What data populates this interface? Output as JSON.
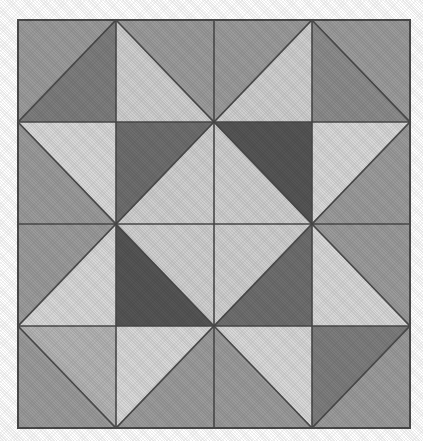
{
  "figure": {
    "kind": "geometric-pattern",
    "grid_rows": 4,
    "grid_cols": 4,
    "canvas_width": 423,
    "canvas_height": 441,
    "pattern_left": 18,
    "pattern_top": 20,
    "pattern_width": 392,
    "pattern_height": 408,
    "background_color": "#ffffff",
    "line_color": "#4a4a4a",
    "line_width": 1.6,
    "outer_border_color": "#4a4a4a",
    "outer_border_width": 2
  },
  "palette": {
    "lightest": "#d8d8d8",
    "light": "#cfcfcf",
    "medium_light": "#b4b4b4",
    "medium": "#9b9b9b",
    "medium_dark": "#8c8c8c",
    "dark": "#7d7d7d",
    "darker": "#6e6e6e",
    "darkest": "#555555"
  },
  "chart_data": {
    "type": "heatmap",
    "xlabel": "",
    "ylabel": "",
    "grid": {
      "rows": 4,
      "cols": 4
    },
    "legend": [
      {
        "name": "lightest",
        "color": "#d8d8d8"
      },
      {
        "name": "light",
        "color": "#cfcfcf"
      },
      {
        "name": "medium_light",
        "color": "#b4b4b4"
      },
      {
        "name": "medium",
        "color": "#9b9b9b"
      },
      {
        "name": "medium_dark",
        "color": "#8c8c8c"
      },
      {
        "name": "dark",
        "color": "#7d7d7d"
      },
      {
        "name": "darker",
        "color": "#6e6e6e"
      },
      {
        "name": "darkest",
        "color": "#555555"
      }
    ],
    "cells": [
      {
        "row": 0,
        "col": 0,
        "diagonal": "slash",
        "first": "medium",
        "second": "dark"
      },
      {
        "row": 0,
        "col": 1,
        "diagonal": "backslash",
        "first": "medium",
        "second": "light"
      },
      {
        "row": 0,
        "col": 2,
        "diagonal": "slash",
        "first": "medium",
        "second": "light"
      },
      {
        "row": 0,
        "col": 3,
        "diagonal": "backslash",
        "first": "medium",
        "second": "medium_dark"
      },
      {
        "row": 1,
        "col": 0,
        "diagonal": "backslash",
        "first": "lightest",
        "second": "medium"
      },
      {
        "row": 1,
        "col": 1,
        "diagonal": "slash",
        "first": "darker",
        "second": "light"
      },
      {
        "row": 1,
        "col": 2,
        "diagonal": "backslash",
        "first": "darkest",
        "second": "light"
      },
      {
        "row": 1,
        "col": 3,
        "diagonal": "slash",
        "first": "lightest",
        "second": "medium"
      },
      {
        "row": 2,
        "col": 0,
        "diagonal": "slash",
        "first": "medium",
        "second": "lightest"
      },
      {
        "row": 2,
        "col": 1,
        "diagonal": "backslash",
        "first": "light",
        "second": "darkest"
      },
      {
        "row": 2,
        "col": 2,
        "diagonal": "slash",
        "first": "light",
        "second": "darker"
      },
      {
        "row": 2,
        "col": 3,
        "diagonal": "backslash",
        "first": "medium",
        "second": "lightest"
      },
      {
        "row": 3,
        "col": 0,
        "diagonal": "backslash",
        "first": "medium_light",
        "second": "medium"
      },
      {
        "row": 3,
        "col": 1,
        "diagonal": "slash",
        "first": "lightest",
        "second": "medium"
      },
      {
        "row": 3,
        "col": 2,
        "diagonal": "backslash",
        "first": "lightest",
        "second": "medium"
      },
      {
        "row": 3,
        "col": 3,
        "diagonal": "slash",
        "first": "dark",
        "second": "medium"
      }
    ],
    "gridlines": {
      "vertical_x": [
        18,
        116,
        214,
        312,
        410
      ],
      "horizontal_y": [
        20,
        122,
        224,
        326,
        428
      ]
    }
  }
}
